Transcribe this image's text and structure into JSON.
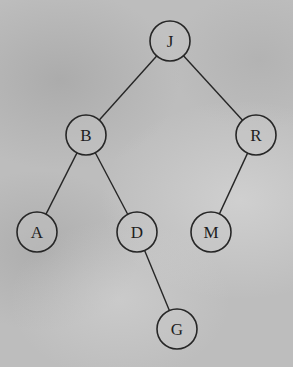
{
  "diagram": {
    "type": "binary-tree",
    "background_color": "#bdbdbd",
    "line_color": "#262626",
    "node_radius": 20,
    "nodes": [
      {
        "id": "J",
        "label": "J",
        "x": 170,
        "y": 41
      },
      {
        "id": "B",
        "label": "B",
        "x": 86,
        "y": 135
      },
      {
        "id": "R",
        "label": "R",
        "x": 256,
        "y": 135
      },
      {
        "id": "A",
        "label": "A",
        "x": 37,
        "y": 232
      },
      {
        "id": "D",
        "label": "D",
        "x": 137,
        "y": 232
      },
      {
        "id": "M",
        "label": "M",
        "x": 211,
        "y": 232
      },
      {
        "id": "G",
        "label": "G",
        "x": 177,
        "y": 329
      }
    ],
    "edges": [
      {
        "from": "J",
        "to": "B"
      },
      {
        "from": "J",
        "to": "R"
      },
      {
        "from": "B",
        "to": "A"
      },
      {
        "from": "B",
        "to": "D"
      },
      {
        "from": "R",
        "to": "M"
      },
      {
        "from": "D",
        "to": "G"
      }
    ]
  }
}
